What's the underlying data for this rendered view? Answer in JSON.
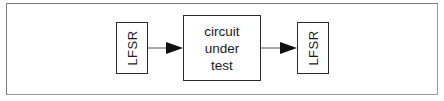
{
  "diagram": {
    "type": "block-diagram",
    "nodes": [
      {
        "id": "lfsr-in",
        "label": "LFSR",
        "orientation": "vertical"
      },
      {
        "id": "cut",
        "lines": [
          "circuit",
          "under",
          "test"
        ]
      },
      {
        "id": "lfsr-out",
        "label": "LFSR",
        "orientation": "vertical"
      }
    ],
    "edges": [
      {
        "from": "lfsr-in",
        "to": "cut"
      },
      {
        "from": "cut",
        "to": "lfsr-out"
      }
    ],
    "colors": {
      "stroke": "#2a2a2a",
      "frame": "#7a7a7a",
      "background": "#ffffff"
    }
  }
}
